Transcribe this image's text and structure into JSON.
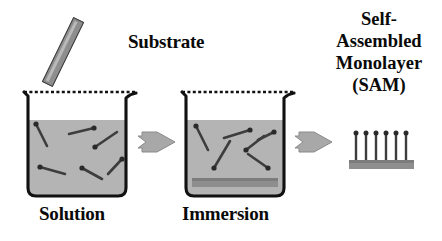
{
  "diagram": {
    "title_text": "Self-Assembled Monolayer (SAM) formation by solution immersion",
    "background_color": "#ffffff",
    "ink_color": "#0a0a0a",
    "colors": {
      "solution_fill": "#b8b8b8",
      "solution_fill_dark": "#ababab",
      "beaker_outline": "#111111",
      "molecule_color": "#3d3d3d",
      "molecule_head_color": "#2a2a2a",
      "substrate_gray": "#8e8e8e",
      "substrate_gray_dark": "#7c7c7c",
      "substrate_highlight": "#b9b9b9",
      "arrow_fill": "#a8a8a8",
      "arrow_stroke": "#8a8a8a",
      "sam_bar_fill": "#8e8e8e"
    }
  },
  "labels": {
    "substrate": "Substrate",
    "solution": "Solution",
    "immersion": "Immersion",
    "sam_line_1": "Self-",
    "sam_line_2": "Assembled",
    "sam_line_3": "Monolayer",
    "sam_line_4": "(SAM)"
  },
  "stages": [
    {
      "id": "solution",
      "label": "Solution",
      "description": "Beaker containing thiol molecules dispersed randomly in solution",
      "molecule_count": 6,
      "has_immersed_substrate": false
    },
    {
      "id": "immersion",
      "label": "Immersion",
      "description": "Substrate immersed at the bottom of the beaker while molecules adsorb",
      "molecule_count": 6,
      "has_immersed_substrate": true
    },
    {
      "id": "sam",
      "label": "Self-Assembled Monolayer (SAM)",
      "description": "Ordered monolayer of molecules standing upright on the substrate",
      "molecule_count": 6,
      "has_immersed_substrate": true
    }
  ],
  "arrows": [
    {
      "id": "arrow-1",
      "from": "solution",
      "to": "immersion",
      "direction": "right"
    },
    {
      "id": "arrow-2",
      "from": "immersion",
      "to": "sam",
      "direction": "right"
    }
  ],
  "beaker_1_molecules": [
    {
      "x1": 14,
      "y1": 40,
      "x2": 25,
      "y2": 62,
      "head": "start"
    },
    {
      "x1": 47,
      "y1": 50,
      "x2": 72,
      "y2": 44,
      "head": "end"
    },
    {
      "x1": 73,
      "y1": 63,
      "x2": 95,
      "y2": 48,
      "head": "start"
    },
    {
      "x1": 18,
      "y1": 83,
      "x2": 43,
      "y2": 90,
      "head": "start"
    },
    {
      "x1": 60,
      "y1": 84,
      "x2": 80,
      "y2": 95,
      "head": "start"
    },
    {
      "x1": 86,
      "y1": 90,
      "x2": 100,
      "y2": 75,
      "head": "end"
    }
  ],
  "beaker_2_molecules": [
    {
      "x1": 16,
      "y1": 42,
      "x2": 28,
      "y2": 66,
      "head": "start"
    },
    {
      "x1": 44,
      "y1": 54,
      "x2": 70,
      "y2": 46,
      "head": "end"
    },
    {
      "x1": 78,
      "y1": 56,
      "x2": 94,
      "y2": 48,
      "head": "end"
    },
    {
      "x1": 34,
      "y1": 84,
      "x2": 50,
      "y2": 57,
      "head": "start"
    },
    {
      "x1": 66,
      "y1": 66,
      "x2": 84,
      "y2": 52,
      "head": "start"
    },
    {
      "x1": 68,
      "y1": 70,
      "x2": 88,
      "y2": 84,
      "head": "end"
    }
  ],
  "sam_molecules": {
    "count": 6,
    "orientation": "vertical",
    "head_position": "top",
    "spacing_px": 10,
    "height_px": 26
  }
}
